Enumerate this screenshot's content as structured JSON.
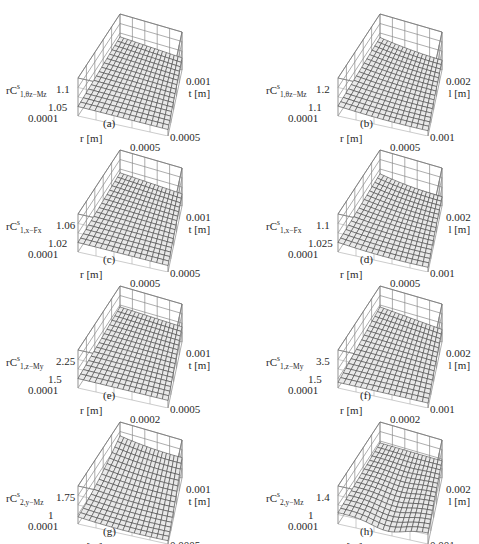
{
  "figure": {
    "panels": [
      {
        "id": "a",
        "caption": "(a)",
        "zlabel": {
          "base": "rC",
          "sup": "s",
          "sub": "1,θz−Mz"
        },
        "z_ticks": [
          "1.1",
          "1.05"
        ],
        "r_ticks": [
          "0.0001",
          "0.0005"
        ],
        "t_ticks": [
          "0.001",
          "0.0005"
        ],
        "r_label": "r [m]",
        "t_label": "t [m]"
      },
      {
        "id": "b",
        "caption": "(b)",
        "zlabel": {
          "base": "rC",
          "sup": "s",
          "sub": "1,θz−Mz"
        },
        "z_ticks": [
          "1.2",
          "1.1"
        ],
        "r_ticks": [
          "0.0001",
          "0.0005"
        ],
        "t_ticks": [
          "0.002",
          "0.001"
        ],
        "r_label": "r [m]",
        "t_label": "l [m]"
      },
      {
        "id": "c",
        "caption": "(c)",
        "zlabel": {
          "base": "rC",
          "sup": "s",
          "sub": "1,x−Fx"
        },
        "z_ticks": [
          "1.06",
          "1.02"
        ],
        "r_ticks": [
          "0.0001",
          "0.0005"
        ],
        "t_ticks": [
          "0.001",
          "0.0005"
        ],
        "r_label": "r [m]",
        "t_label": "t [m]"
      },
      {
        "id": "d",
        "caption": "(d)",
        "zlabel": {
          "base": "rC",
          "sup": "s",
          "sub": "1,x−Fx"
        },
        "z_ticks": [
          "1.1",
          "1.025"
        ],
        "r_ticks": [
          "0.0001",
          "0.0005"
        ],
        "t_ticks": [
          "0.002",
          "0.001"
        ],
        "r_label": "r [m]",
        "t_label": "l [m]"
      },
      {
        "id": "e",
        "caption": "(e)",
        "zlabel": {
          "base": "rC",
          "sup": "s",
          "sub": "1,z−My"
        },
        "z_ticks": [
          "2.25",
          "1.5"
        ],
        "r_ticks": [
          "0.0001",
          "0.0002"
        ],
        "t_ticks": [
          "0.001",
          "0.0005"
        ],
        "r_label": "r [m]",
        "t_label": "t [m]"
      },
      {
        "id": "f",
        "caption": "(f)",
        "zlabel": {
          "base": "rC",
          "sup": "s",
          "sub": "1,z−My"
        },
        "z_ticks": [
          "3.5",
          "1.5"
        ],
        "r_ticks": [
          "0.0001",
          "0.0002"
        ],
        "t_ticks": [
          "0.002",
          "0.001"
        ],
        "r_label": "r [m]",
        "t_label": "l [m]"
      },
      {
        "id": "g",
        "caption": "(g)",
        "zlabel": {
          "base": "rC",
          "sup": "s",
          "sub": "2,y−Mz"
        },
        "z_ticks": [
          "1.75",
          "1"
        ],
        "r_ticks": [
          "0.0001",
          "0.0002"
        ],
        "t_ticks": [
          "0.001",
          "0.0005"
        ],
        "r_label": "r [m]",
        "t_label": "t [m]"
      },
      {
        "id": "h",
        "caption": "(h)",
        "zlabel": {
          "base": "rC",
          "sup": "s",
          "sub": "2,y−Mz"
        },
        "z_ticks": [
          "1.4",
          "1"
        ],
        "r_ticks": [
          "0.0001",
          "0.00015"
        ],
        "t_ticks": [
          "0.002",
          "0.001"
        ],
        "r_label": "r [m]",
        "t_label": "l [m]"
      }
    ]
  },
  "chart_data": [
    {
      "type": "surface",
      "panel": "(a)",
      "zlabel": "rC^s_{1,θz−Mz}",
      "xlabel": "r [m]",
      "ylabel": "t [m]",
      "x_range": [
        0.0001,
        0.0005
      ],
      "y_range": [
        0.0005,
        0.001
      ],
      "z_ticks": [
        1.05,
        1.1
      ],
      "grid": true,
      "shape": "gently increasing plane toward small r / large t"
    },
    {
      "type": "surface",
      "panel": "(b)",
      "zlabel": "rC^s_{1,θz−Mz}",
      "xlabel": "r [m]",
      "ylabel": "l [m]",
      "x_range": [
        0.0001,
        0.0005
      ],
      "y_range": [
        0.001,
        0.002
      ],
      "z_ticks": [
        1.1,
        1.2
      ],
      "grid": true,
      "shape": "slightly curved surface, minimum near large r small l"
    },
    {
      "type": "surface",
      "panel": "(c)",
      "zlabel": "rC^s_{1,x−Fx}",
      "xlabel": "r [m]",
      "ylabel": "t [m]",
      "x_range": [
        0.0001,
        0.0005
      ],
      "y_range": [
        0.0005,
        0.001
      ],
      "z_ticks": [
        1.02,
        1.06
      ],
      "grid": true,
      "shape": "gently increasing plane"
    },
    {
      "type": "surface",
      "panel": "(d)",
      "zlabel": "rC^s_{1,x−Fx}",
      "xlabel": "r [m]",
      "ylabel": "l [m]",
      "x_range": [
        0.0001,
        0.0005
      ],
      "y_range": [
        0.001,
        0.002
      ],
      "z_ticks": [
        1.025,
        1.1
      ],
      "grid": true,
      "shape": "slightly curved surface"
    },
    {
      "type": "surface",
      "panel": "(e)",
      "zlabel": "rC^s_{1,z−My}",
      "xlabel": "r [m]",
      "ylabel": "t [m]",
      "x_range": [
        0.0001,
        0.0002
      ],
      "y_range": [
        0.0005,
        0.001
      ],
      "z_ticks": [
        1.5,
        2.25
      ],
      "grid": true,
      "shape": "increasing plane"
    },
    {
      "type": "surface",
      "panel": "(f)",
      "zlabel": "rC^s_{1,z−My}",
      "xlabel": "r [m]",
      "ylabel": "l [m]",
      "x_range": [
        0.0001,
        0.0002
      ],
      "y_range": [
        0.001,
        0.002
      ],
      "z_ticks": [
        1.5,
        3.5
      ],
      "grid": true,
      "shape": "sloped surface dipping toward large r small l"
    },
    {
      "type": "surface",
      "panel": "(g)",
      "zlabel": "rC^s_{2,y−Mz}",
      "xlabel": "r [m]",
      "ylabel": "t [m]",
      "x_range": [
        0.0001,
        0.0002
      ],
      "y_range": [
        0.0005,
        0.001
      ],
      "z_ticks": [
        1,
        1.75
      ],
      "grid": true,
      "shape": "curved bowl rising toward large t"
    },
    {
      "type": "surface",
      "panel": "(h)",
      "zlabel": "rC^s_{2,y−Mz}",
      "xlabel": "r [m]",
      "ylabel": "l [m]",
      "x_range": [
        0.0001,
        0.00015
      ],
      "y_range": [
        0.001,
        0.002
      ],
      "z_ticks": [
        1,
        1.4
      ],
      "grid": true,
      "shape": "curved surface with dip near small l"
    }
  ]
}
